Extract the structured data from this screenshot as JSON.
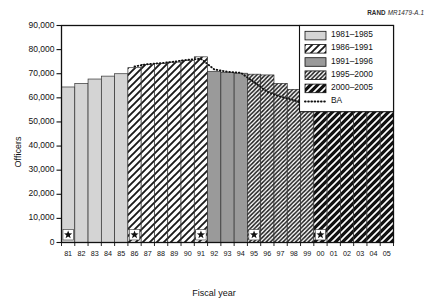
{
  "figure": {
    "rand_label": "RAND",
    "rand_number": "MR1479-A.1"
  },
  "axes": {
    "ylabel": "Officers",
    "xlabel": "Fiscal year",
    "yticks": [
      "0",
      "10,000",
      "20,000",
      "30,000",
      "40,000",
      "50,000",
      "60,000",
      "70,000",
      "80,000",
      "90,000"
    ],
    "xticks": [
      "81",
      "82",
      "83",
      "84",
      "85",
      "86",
      "87",
      "88",
      "89",
      "90",
      "91",
      "92",
      "93",
      "94",
      "95",
      "96",
      "97",
      "98",
      "99",
      "00",
      "01",
      "02",
      "03",
      "04",
      "05"
    ]
  },
  "legend": {
    "items": [
      {
        "label": "1981–1985",
        "swatch": "solid-light-gray"
      },
      {
        "label": "1986–1991",
        "swatch": "white-wide-diagonal"
      },
      {
        "label": "1991–1996",
        "swatch": "solid-medium-gray"
      },
      {
        "label": "1995–2000",
        "swatch": "white-dense-diagonal"
      },
      {
        "label": "2000–2005",
        "swatch": "black-white-diagonal"
      },
      {
        "label": "BA",
        "swatch": "dotted-line"
      }
    ]
  },
  "chart_data": {
    "type": "bar",
    "title": "",
    "xlabel": "Fiscal year",
    "ylabel": "Officers",
    "ylim": [
      0,
      90000
    ],
    "ytick_step": 10000,
    "grid": false,
    "legend_position": "top-right",
    "categories": [
      "81",
      "82",
      "83",
      "84",
      "85",
      "86",
      "87",
      "88",
      "89",
      "90",
      "91",
      "92",
      "93",
      "94",
      "95",
      "96",
      "97",
      "98",
      "99",
      "00",
      "01",
      "02",
      "03",
      "04",
      "05"
    ],
    "values": [
      64500,
      66000,
      67800,
      69000,
      70000,
      72500,
      73800,
      74200,
      74800,
      75500,
      77000,
      71000,
      70500,
      70200,
      69800,
      69500,
      66000,
      63500,
      62000,
      55200,
      55200,
      55200,
      55200,
      55200,
      55200
    ],
    "groups": [
      {
        "name": "1981–1985",
        "start": "81",
        "end": "85",
        "fill": "solid-light-gray",
        "color": "#d4d4d4"
      },
      {
        "name": "1986–1991",
        "start": "86",
        "end": "91",
        "fill": "white-wide-diagonal",
        "color": "#ffffff"
      },
      {
        "name": "1991–1996",
        "start": "92",
        "end": "94",
        "fill": "solid-medium-gray",
        "color": "#9a9a9a"
      },
      {
        "name": "1995–2000",
        "start": "95",
        "end": "99",
        "fill": "white-dense-diagonal",
        "color": "#ffffff"
      },
      {
        "name": "2000–2005",
        "start": "00",
        "end": "05",
        "fill": "black-white-diagonal",
        "color": "#111111"
      }
    ],
    "series": [
      {
        "name": "BA",
        "type": "line",
        "style": "dotted",
        "x": [
          "86",
          "87",
          "88",
          "89",
          "90",
          "91",
          "92",
          "93",
          "94",
          "95",
          "96",
          "97",
          "98",
          "99",
          "00",
          "01",
          "02",
          "03",
          "04",
          "05"
        ],
        "values": [
          73000,
          74000,
          74400,
          75000,
          75800,
          76200,
          71800,
          70800,
          70400,
          66500,
          62500,
          60500,
          59000,
          57000,
          55800,
          55400,
          55300,
          55200,
          55200,
          55200
        ]
      }
    ],
    "markers": [
      {
        "name": "star",
        "x": "81",
        "y": 3200
      },
      {
        "name": "star",
        "x": "86",
        "y": 3200
      },
      {
        "name": "star",
        "x": "91",
        "y": 3200
      },
      {
        "name": "star",
        "x": "95",
        "y": 3200
      },
      {
        "name": "star",
        "x": "00",
        "y": 3200
      }
    ]
  }
}
